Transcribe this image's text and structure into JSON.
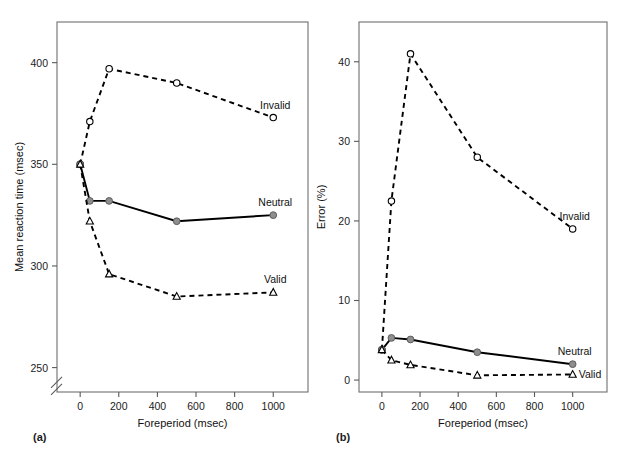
{
  "figure": {
    "background": "#ffffff",
    "panel_a_label": "(a)",
    "panel_b_label": "(b)"
  },
  "chart_data": [
    {
      "id": "panel_a",
      "type": "line",
      "title": "",
      "panel_label": "(a)",
      "xlabel": "Foreperiod (msec)",
      "ylabel": "Mean reaction time (msec)",
      "xlim": [
        -120,
        1180
      ],
      "ylim": [
        238,
        420
      ],
      "xticks": [
        0,
        200,
        400,
        600,
        800,
        1000
      ],
      "xtick_labels": [
        "0",
        "200",
        "400",
        "600",
        "800",
        "1000"
      ],
      "yticks": [
        250,
        300,
        350,
        400
      ],
      "ytick_labels": [
        "250",
        "300",
        "350",
        "400"
      ],
      "y_axis_break": true,
      "y_axis_break_value": 245,
      "grid": false,
      "legend_position": "inline-right",
      "series": [
        {
          "name": "Invalid",
          "marker": "open-circle",
          "linestyle": "dashed",
          "label_anchor": "above",
          "x": [
            0,
            50,
            150,
            500,
            1000
          ],
          "values": [
            350,
            371,
            397,
            390,
            373
          ]
        },
        {
          "name": "Neutral",
          "marker": "filled-circle",
          "linestyle": "solid",
          "label_anchor": "above",
          "x": [
            0,
            50,
            150,
            500,
            1000
          ],
          "values": [
            350,
            332,
            332,
            322,
            325
          ]
        },
        {
          "name": "Valid",
          "marker": "open-triangle",
          "linestyle": "dashed",
          "label_anchor": "above",
          "x": [
            0,
            50,
            150,
            500,
            1000
          ],
          "values": [
            350,
            322,
            296,
            285,
            287
          ]
        }
      ]
    },
    {
      "id": "panel_b",
      "type": "line",
      "title": "",
      "panel_label": "(b)",
      "xlabel": "Foreperiod (msec)",
      "ylabel": "Error (%)",
      "xlim": [
        -120,
        1180
      ],
      "ylim": [
        -1.5,
        45
      ],
      "xticks": [
        0,
        200,
        400,
        600,
        800,
        1000
      ],
      "xtick_labels": [
        "0",
        "200",
        "400",
        "600",
        "800",
        "1000"
      ],
      "yticks": [
        0,
        10,
        20,
        30,
        40
      ],
      "ytick_labels": [
        "0",
        "10",
        "20",
        "30",
        "40"
      ],
      "y_axis_break": false,
      "grid": false,
      "legend_position": "inline-right",
      "series": [
        {
          "name": "Invalid",
          "marker": "open-circle",
          "linestyle": "dashed",
          "label_anchor": "above",
          "x": [
            0,
            50,
            150,
            500,
            1000
          ],
          "values": [
            3.8,
            22.5,
            41.0,
            28.0,
            19.0
          ]
        },
        {
          "name": "Neutral",
          "marker": "filled-circle",
          "linestyle": "solid",
          "label_anchor": "above",
          "x": [
            0,
            50,
            150,
            500,
            1000
          ],
          "values": [
            3.8,
            5.3,
            5.1,
            3.5,
            2.0
          ]
        },
        {
          "name": "Valid",
          "marker": "open-triangle",
          "linestyle": "dashed",
          "label_anchor": "right",
          "x": [
            0,
            50,
            150,
            500,
            1000
          ],
          "values": [
            3.8,
            2.5,
            1.9,
            0.6,
            0.7
          ]
        }
      ]
    }
  ]
}
